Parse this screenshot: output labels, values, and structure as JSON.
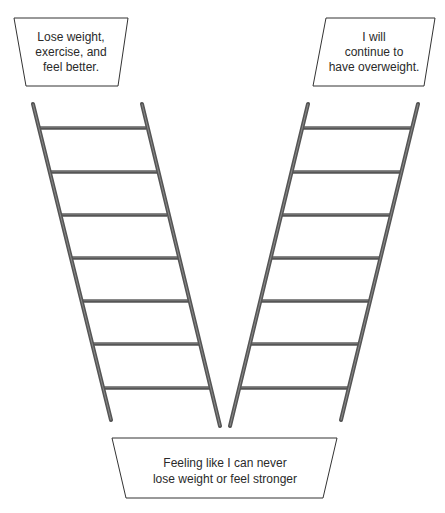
{
  "diagram": {
    "type": "two-ladders",
    "colors": {
      "rail": "#555555",
      "rail_highlight": "#8a8a8a",
      "box_stroke": "#333333",
      "text": "#2a2a2a",
      "background": "#ffffff"
    },
    "top_left_box": {
      "lines": [
        "Lose weight,",
        "exercise, and",
        "feel better."
      ]
    },
    "top_right_box": {
      "lines": [
        "I will",
        "continue to",
        "have overweight."
      ]
    },
    "bottom_box": {
      "lines": [
        "Feeling like I can never",
        "lose weight or feel stronger"
      ]
    },
    "left_ladder": {
      "rungs": 7
    },
    "right_ladder": {
      "rungs": 7
    }
  }
}
